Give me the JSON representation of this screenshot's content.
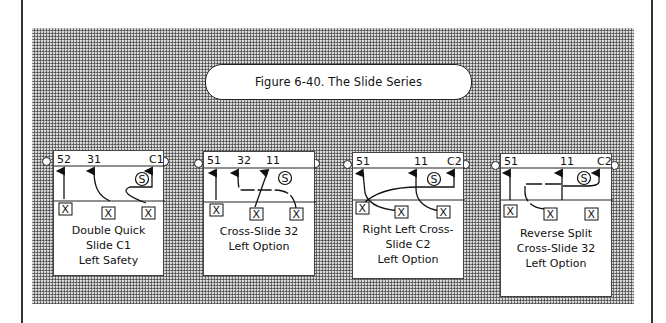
{
  "figure": {
    "title": "Figure 6-40. The Slide Series"
  },
  "colors": {
    "background": "#ffffff",
    "halftone": "#8a8a8a",
    "ink": "#111111"
  },
  "panels": [
    {
      "id": "double-quick-slide-c1",
      "labels": [
        {
          "text": "52",
          "x": 3,
          "y": 12
        },
        {
          "text": "31",
          "x": 33,
          "y": 12
        },
        {
          "text": "C1",
          "x": 95,
          "y": 12
        }
      ],
      "caption": [
        "Double Quick",
        "Slide C1",
        "Left Safety"
      ],
      "x_boxes": [
        {
          "label": "X",
          "x": 5,
          "y": 45
        },
        {
          "label": "X",
          "x": 48,
          "y": 49
        },
        {
          "label": "X",
          "x": 88,
          "y": 49
        }
      ],
      "safety": {
        "label": "S",
        "x": 82,
        "y": 30
      }
    },
    {
      "id": "cross-slide-32-left-option",
      "labels": [
        {
          "text": "51",
          "x": 3,
          "y": 10
        },
        {
          "text": "32",
          "x": 33,
          "y": 10
        },
        {
          "text": "11",
          "x": 62,
          "y": 10
        }
      ],
      "caption": [
        "Cross-Slide 32",
        "Left Option"
      ],
      "x_boxes": [
        {
          "label": "X",
          "x": 6,
          "y": 42
        },
        {
          "label": "X",
          "x": 46,
          "y": 46
        },
        {
          "label": "X",
          "x": 86,
          "y": 46
        }
      ],
      "safety": {
        "label": "S",
        "x": 78,
        "y": 26
      }
    },
    {
      "id": "right-left-cross-slide-c2",
      "labels": [
        {
          "text": "51",
          "x": 3,
          "y": 10
        },
        {
          "text": "11",
          "x": 61,
          "y": 10
        },
        {
          "text": "C2",
          "x": 94,
          "y": 10
        }
      ],
      "caption": [
        "Right Left Cross-",
        "Slide C2",
        "Left Option"
      ],
      "x_boxes": [
        {
          "label": "X",
          "x": 4,
          "y": 40
        },
        {
          "label": "X",
          "x": 43,
          "y": 44
        },
        {
          "label": "X",
          "x": 84,
          "y": 44
        }
      ],
      "safety": {
        "label": "S",
        "x": 79,
        "y": 23
      }
    },
    {
      "id": "reverse-split-cross-slide-32",
      "labels": [
        {
          "text": "51",
          "x": 3,
          "y": 9
        },
        {
          "text": "11",
          "x": 59,
          "y": 9
        },
        {
          "text": "C2",
          "x": 96,
          "y": 9
        }
      ],
      "caption": [
        "Reverse Split",
        "Cross-Slide 32",
        "Left Option"
      ],
      "x_boxes": [
        {
          "label": "X",
          "x": 4,
          "y": 37
        },
        {
          "label": "X",
          "x": 43,
          "y": 40
        },
        {
          "label": "X",
          "x": 84,
          "y": 40
        }
      ],
      "safety": {
        "label": "S",
        "x": 80,
        "y": 22
      }
    }
  ]
}
